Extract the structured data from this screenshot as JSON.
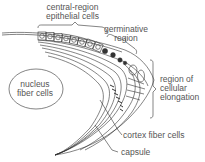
{
  "diagram": {
    "stroke_color": "#333333",
    "label_color": "#555555",
    "labels": {
      "central_region": [
        "central-region",
        "epithelial cells"
      ],
      "germinative": [
        "germinative",
        "region"
      ],
      "elongation": [
        "region of",
        "cellular",
        "elongation"
      ],
      "nucleus": [
        "nucleus",
        "fiber cells"
      ],
      "cortex": "cortex fiber cells",
      "capsule": "capsule"
    }
  }
}
